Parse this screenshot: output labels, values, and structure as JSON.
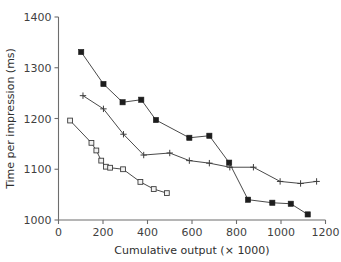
{
  "chart_data": {
    "type": "line",
    "title": "",
    "xlabel": "Cumulative output (× 1000)",
    "ylabel": "Time per impression (ms)",
    "xlim": [
      0,
      1200
    ],
    "ylim": [
      1000,
      1400
    ],
    "xticks": [
      0,
      200,
      400,
      600,
      800,
      1000,
      1200
    ],
    "yticks": [
      1000,
      1100,
      1200,
      1300,
      1400
    ],
    "xtick_labels": [
      "0",
      "200",
      "400",
      "600",
      "800",
      "1000",
      "1200"
    ],
    "ytick_labels": [
      "1000",
      "1100",
      "1200",
      "1300",
      "1400"
    ],
    "grid": false,
    "legend": "none",
    "series": [
      {
        "name": "filled-square-series",
        "marker": "filled-square",
        "color": "#1d1d1d",
        "points": [
          {
            "x": 102,
            "y": 1331
          },
          {
            "x": 202,
            "y": 1268
          },
          {
            "x": 288,
            "y": 1232
          },
          {
            "x": 372,
            "y": 1237
          },
          {
            "x": 438,
            "y": 1197
          },
          {
            "x": 588,
            "y": 1162
          },
          {
            "x": 678,
            "y": 1166
          },
          {
            "x": 767,
            "y": 1113
          },
          {
            "x": 852,
            "y": 1040
          },
          {
            "x": 961,
            "y": 1034
          },
          {
            "x": 1044,
            "y": 1032
          },
          {
            "x": 1120,
            "y": 1011
          }
        ]
      },
      {
        "name": "plus-series",
        "marker": "plus",
        "color": "#3c3c3c",
        "points": [
          {
            "x": 110,
            "y": 1245
          },
          {
            "x": 202,
            "y": 1219
          },
          {
            "x": 292,
            "y": 1169
          },
          {
            "x": 383,
            "y": 1128
          },
          {
            "x": 500,
            "y": 1132
          },
          {
            "x": 588,
            "y": 1117
          },
          {
            "x": 678,
            "y": 1112
          },
          {
            "x": 770,
            "y": 1104
          },
          {
            "x": 876,
            "y": 1104
          },
          {
            "x": 996,
            "y": 1076
          },
          {
            "x": 1088,
            "y": 1072
          },
          {
            "x": 1160,
            "y": 1076
          }
        ]
      },
      {
        "name": "open-square-series",
        "marker": "open-square",
        "color": "#3c3c3c",
        "points": [
          {
            "x": 52,
            "y": 1196
          },
          {
            "x": 148,
            "y": 1152
          },
          {
            "x": 170,
            "y": 1137
          },
          {
            "x": 192,
            "y": 1117
          },
          {
            "x": 213,
            "y": 1105
          },
          {
            "x": 232,
            "y": 1103
          },
          {
            "x": 290,
            "y": 1100
          },
          {
            "x": 368,
            "y": 1075
          },
          {
            "x": 428,
            "y": 1061
          },
          {
            "x": 487,
            "y": 1053
          }
        ]
      }
    ]
  }
}
